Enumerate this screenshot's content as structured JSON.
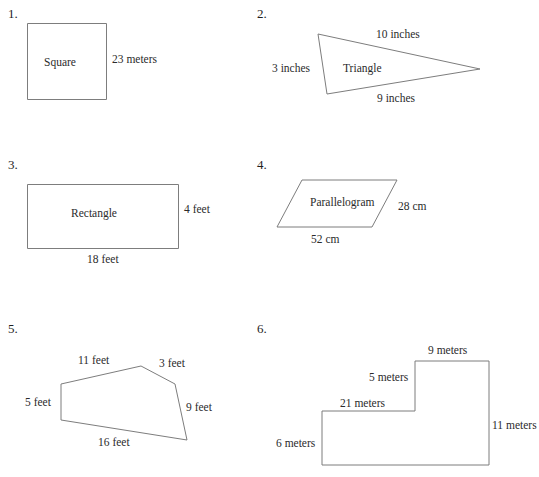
{
  "worksheet": {
    "items": [
      {
        "number": "1.",
        "shape_name": "Square",
        "shape_type": "square",
        "labels": [
          {
            "text": "23 meters",
            "side": "right"
          }
        ]
      },
      {
        "number": "2.",
        "shape_name": "Triangle",
        "shape_type": "triangle",
        "labels": [
          {
            "text": "10 inches",
            "side": "top"
          },
          {
            "text": "3 inches",
            "side": "left"
          },
          {
            "text": "9 inches",
            "side": "bottom"
          }
        ]
      },
      {
        "number": "3.",
        "shape_name": "Rectangle",
        "shape_type": "rectangle",
        "labels": [
          {
            "text": "4 feet",
            "side": "right"
          },
          {
            "text": "18 feet",
            "side": "bottom"
          }
        ]
      },
      {
        "number": "4.",
        "shape_name": "Parallelogram",
        "shape_type": "parallelogram",
        "labels": [
          {
            "text": "28 cm",
            "side": "right"
          },
          {
            "text": "52 cm",
            "side": "bottom"
          }
        ]
      },
      {
        "number": "5.",
        "shape_name": "",
        "shape_type": "pentagon",
        "labels": [
          {
            "text": "11 feet",
            "side": "top-left"
          },
          {
            "text": "3 feet",
            "side": "top-right"
          },
          {
            "text": "5 feet",
            "side": "left"
          },
          {
            "text": "9 feet",
            "side": "right"
          },
          {
            "text": "16 feet",
            "side": "bottom"
          }
        ]
      },
      {
        "number": "6.",
        "shape_name": "",
        "shape_type": "l-shape",
        "labels": [
          {
            "text": "9 meters",
            "side": "top-right"
          },
          {
            "text": "5 meters",
            "side": "inner-vertical"
          },
          {
            "text": "21 meters",
            "side": "upper-horizontal"
          },
          {
            "text": "11 meters",
            "side": "right"
          },
          {
            "text": "6 meters",
            "side": "left"
          }
        ]
      }
    ]
  },
  "colors": {
    "stroke": "#7d7d7d",
    "text": "#2b2b2b",
    "background": "#ffffff"
  }
}
